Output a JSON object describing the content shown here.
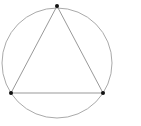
{
  "diagram": {
    "type": "inscribed-equilateral-triangle",
    "colors": {
      "background": "#ffffff",
      "circle_stroke": "#aaaaaa",
      "triangle_stroke": "#999999",
      "vertex_fill": "#111111"
    },
    "circle": {
      "cx": 57,
      "cy": 63,
      "r": 55
    },
    "vertices": [
      {
        "name": "top",
        "x": 57,
        "y": 6
      },
      {
        "name": "bottom-left",
        "x": 11,
        "y": 93
      },
      {
        "name": "bottom-right",
        "x": 103,
        "y": 93
      }
    ]
  }
}
